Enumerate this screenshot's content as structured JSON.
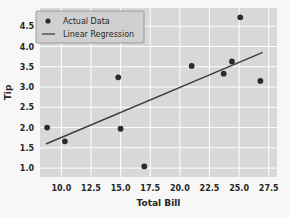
{
  "chart_data": {
    "type": "scatter",
    "title": "",
    "xlabel": "Total Bill",
    "ylabel": "Tip",
    "xlim": [
      8.2,
      28.2
    ],
    "ylim": [
      0.78,
      4.95
    ],
    "xticks": [
      "10.0",
      "12.5",
      "15.0",
      "17.5",
      "20.0",
      "22.5",
      "25.0",
      "27.5"
    ],
    "xtick_values": [
      10.0,
      12.5,
      15.0,
      17.5,
      20.0,
      22.5,
      25.0,
      27.5
    ],
    "yticks": [
      "1.0",
      "1.5",
      "2.0",
      "2.5",
      "3.0",
      "3.5",
      "4.0",
      "4.5"
    ],
    "ytick_values": [
      1.0,
      1.5,
      2.0,
      2.5,
      3.0,
      3.5,
      4.0,
      4.5
    ],
    "grid": true,
    "legend_position": "upper left",
    "series": [
      {
        "name": "Actual Data",
        "type": "scatter",
        "marker": "circle",
        "color": "#2b2b2b",
        "points": [
          {
            "x": 8.8,
            "y": 2.0
          },
          {
            "x": 10.3,
            "y": 1.66
          },
          {
            "x": 14.8,
            "y": 3.24
          },
          {
            "x": 15.0,
            "y": 1.97
          },
          {
            "x": 17.0,
            "y": 1.04
          },
          {
            "x": 21.0,
            "y": 3.52
          },
          {
            "x": 23.7,
            "y": 3.33
          },
          {
            "x": 24.4,
            "y": 3.63
          },
          {
            "x": 25.1,
            "y": 4.72
          },
          {
            "x": 26.8,
            "y": 3.15
          }
        ]
      },
      {
        "name": "Linear Regression",
        "type": "line",
        "color": "#3d3d3d",
        "endpoints": [
          {
            "x": 8.75,
            "y": 1.6
          },
          {
            "x": 26.95,
            "y": 3.85
          }
        ]
      }
    ],
    "colors": {
      "figure_background": "#f7f7f7",
      "axes_background": "#d8d8d8",
      "grid": "#ffffff",
      "marker": "#2b2b2b",
      "line": "#3d3d3d",
      "text": "#262626",
      "legend_background": "#d0d0d0",
      "legend_border": "#8c8c8c"
    }
  },
  "legend": {
    "items": [
      {
        "label": "Actual Data",
        "kind": "marker"
      },
      {
        "label": "Linear Regression",
        "kind": "line"
      }
    ]
  }
}
